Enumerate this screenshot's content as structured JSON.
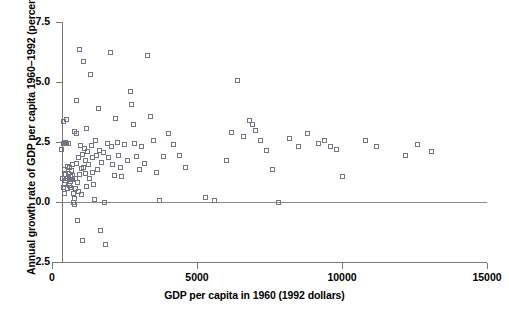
{
  "chart_data": {
    "type": "scatter",
    "title": "",
    "xlabel": "GDP per capita in 1960 (1992 dollars)",
    "ylabel": "Annual growth rate of GDP per capita 1960–1992 (percent)",
    "xlim": [
      0,
      15000
    ],
    "ylim": [
      -2.5,
      7.5
    ],
    "xticks": [
      0,
      5000,
      10000,
      15000
    ],
    "xticklabels": [
      "0",
      "5000",
      "10000",
      "15000"
    ],
    "yticks": [
      -2.5,
      0.0,
      2.5,
      5.0,
      7.5
    ],
    "yticklabels": [
      "-2.5",
      "0.0",
      "2.5",
      "5.0",
      "7.5"
    ],
    "grid": false,
    "legend": null,
    "marker": "open-square",
    "marker_color": "#6f7585",
    "reference_lines": [
      {
        "axis": "y",
        "value": 0.0,
        "color": "#8a8a8a"
      }
    ],
    "series": [
      {
        "name": "Countries",
        "points": [
          [
            330,
            2.2
          ],
          [
            360,
            1.0
          ],
          [
            380,
            0.6
          ],
          [
            390,
            3.35
          ],
          [
            400,
            2.45
          ],
          [
            420,
            1.35
          ],
          [
            430,
            0.75
          ],
          [
            440,
            0.35
          ],
          [
            455,
            2.5
          ],
          [
            470,
            1.15
          ],
          [
            480,
            0.9
          ],
          [
            500,
            3.45
          ],
          [
            510,
            2.45
          ],
          [
            520,
            1.5
          ],
          [
            530,
            1.0
          ],
          [
            545,
            0.55
          ],
          [
            560,
            2.45
          ],
          [
            575,
            1.2
          ],
          [
            590,
            0.95
          ],
          [
            600,
            0.7
          ],
          [
            610,
            1.45
          ],
          [
            625,
            1.05
          ],
          [
            640,
            0.85
          ],
          [
            655,
            0.6
          ],
          [
            670,
            1.3
          ],
          [
            690,
            0.95
          ],
          [
            700,
            1.55
          ],
          [
            715,
            1.1
          ],
          [
            730,
            0.35
          ],
          [
            745,
            0.0
          ],
          [
            760,
            -0.1
          ],
          [
            775,
            0.15
          ],
          [
            790,
            2.95
          ],
          [
            800,
            1.0
          ],
          [
            815,
            0.55
          ],
          [
            830,
            4.25
          ],
          [
            845,
            2.85
          ],
          [
            860,
            1.6
          ],
          [
            875,
            0.8
          ],
          [
            890,
            -0.75
          ],
          [
            905,
            0.45
          ],
          [
            920,
            1.85
          ],
          [
            940,
            1.15
          ],
          [
            960,
            6.35
          ],
          [
            980,
            2.35
          ],
          [
            1000,
            1.4
          ],
          [
            1020,
            0.3
          ],
          [
            1040,
            -1.6
          ],
          [
            1060,
            2.0
          ],
          [
            1080,
            1.45
          ],
          [
            1100,
            5.85
          ],
          [
            1120,
            2.25
          ],
          [
            1140,
            1.75
          ],
          [
            1160,
            1.2
          ],
          [
            1180,
            0.65
          ],
          [
            1200,
            3.05
          ],
          [
            1230,
            2.1
          ],
          [
            1260,
            1.55
          ],
          [
            1290,
            1.0
          ],
          [
            1320,
            5.3
          ],
          [
            1350,
            2.35
          ],
          [
            1380,
            1.85
          ],
          [
            1410,
            1.25
          ],
          [
            1440,
            0.75
          ],
          [
            1470,
            0.1
          ],
          [
            1500,
            2.55
          ],
          [
            1530,
            1.95
          ],
          [
            1560,
            1.35
          ],
          [
            1600,
            3.9
          ],
          [
            1640,
            2.15
          ],
          [
            1680,
            -1.2
          ],
          [
            1720,
            1.65
          ],
          [
            1760,
            2.05
          ],
          [
            1800,
            0.0
          ],
          [
            1840,
            -1.75
          ],
          [
            1900,
            2.45
          ],
          [
            1950,
            1.85
          ],
          [
            2000,
            6.25
          ],
          [
            2050,
            2.3
          ],
          [
            2100,
            1.55
          ],
          [
            2150,
            1.1
          ],
          [
            2200,
            3.5
          ],
          [
            2250,
            2.5
          ],
          [
            2300,
            1.95
          ],
          [
            2350,
            1.45
          ],
          [
            2400,
            1.05
          ],
          [
            2500,
            2.4
          ],
          [
            2600,
            1.75
          ],
          [
            2700,
            4.6
          ],
          [
            2750,
            4.05
          ],
          [
            2800,
            3.25
          ],
          [
            2850,
            2.45
          ],
          [
            2900,
            1.9
          ],
          [
            3000,
            1.35
          ],
          [
            3100,
            2.3
          ],
          [
            3200,
            1.6
          ],
          [
            3300,
            6.1
          ],
          [
            3400,
            3.55
          ],
          [
            3500,
            2.55
          ],
          [
            3600,
            1.25
          ],
          [
            3700,
            0.05
          ],
          [
            3850,
            1.9
          ],
          [
            4000,
            2.85
          ],
          [
            4200,
            2.4
          ],
          [
            4400,
            1.95
          ],
          [
            4600,
            1.45
          ],
          [
            5300,
            0.2
          ],
          [
            5600,
            0.05
          ],
          [
            6000,
            1.75
          ],
          [
            6200,
            2.9
          ],
          [
            6400,
            5.05
          ],
          [
            6600,
            2.75
          ],
          [
            6800,
            3.4
          ],
          [
            6900,
            3.25
          ],
          [
            7000,
            3.0
          ],
          [
            7200,
            2.55
          ],
          [
            7400,
            2.15
          ],
          [
            7600,
            1.35
          ],
          [
            7800,
            0.0
          ],
          [
            8200,
            2.65
          ],
          [
            8500,
            2.3
          ],
          [
            8800,
            2.85
          ],
          [
            9200,
            2.45
          ],
          [
            9400,
            2.55
          ],
          [
            9600,
            2.3
          ],
          [
            9800,
            2.2
          ],
          [
            10000,
            1.05
          ],
          [
            10800,
            2.55
          ],
          [
            11200,
            2.3
          ],
          [
            12200,
            1.95
          ],
          [
            12600,
            2.4
          ],
          [
            13100,
            2.1
          ]
        ]
      }
    ]
  },
  "axes_geometry": {
    "left_px": 52,
    "right_px": 487,
    "top_px": 22,
    "bottom_px": 262
  }
}
